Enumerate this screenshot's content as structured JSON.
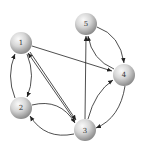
{
  "diagram": {
    "type": "directed-graph",
    "nodes": [
      {
        "id": "1",
        "label": "1",
        "x": 21,
        "y": 43
      },
      {
        "id": "2",
        "label": "2",
        "x": 21,
        "y": 108
      },
      {
        "id": "3",
        "label": "3",
        "x": 85,
        "y": 130
      },
      {
        "id": "4",
        "label": "4",
        "x": 124,
        "y": 75
      },
      {
        "id": "5",
        "label": "5",
        "x": 86,
        "y": 24
      }
    ],
    "edges": [
      {
        "from": "1",
        "to": "4",
        "style": "straight"
      },
      {
        "from": "1",
        "to": "3",
        "style": "straight"
      },
      {
        "from": "3",
        "to": "1",
        "style": "straight"
      },
      {
        "from": "1",
        "to": "2",
        "style": "curved"
      },
      {
        "from": "2",
        "to": "1",
        "style": "curved"
      },
      {
        "from": "2",
        "to": "3",
        "style": "curved"
      },
      {
        "from": "3",
        "to": "2",
        "style": "curved"
      },
      {
        "from": "3",
        "to": "5",
        "style": "straight"
      },
      {
        "from": "3",
        "to": "4",
        "style": "curved"
      },
      {
        "from": "4",
        "to": "3",
        "style": "curved"
      },
      {
        "from": "5",
        "to": "4",
        "style": "curved"
      },
      {
        "from": "4",
        "to": "5",
        "style": "curved"
      }
    ],
    "colors": {
      "node_light": "#f4f4f4",
      "node_dark": "#8c8c8c",
      "edge": "#222222"
    }
  }
}
